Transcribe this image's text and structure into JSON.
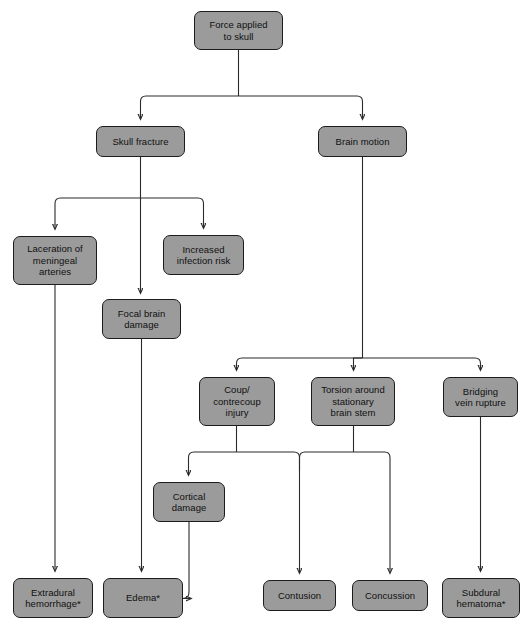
{
  "diagram": {
    "colors": {
      "node_fill": "#9b9b9b",
      "node_border": "#1c1c1c",
      "edge": "#2b2b2b",
      "background": "#ffffff",
      "text": "#101010"
    },
    "footnote_marker": "*",
    "nodes": [
      {
        "id": "force",
        "label": "Force applied\nto skull",
        "x": 194,
        "y": 11,
        "w": 89,
        "h": 39
      },
      {
        "id": "skull",
        "label": "Skull fracture",
        "x": 96,
        "y": 126,
        "w": 89,
        "h": 31
      },
      {
        "id": "brain_motion",
        "label": "Brain motion",
        "x": 318,
        "y": 126,
        "w": 89,
        "h": 31
      },
      {
        "id": "laceration",
        "label": "Laceration of\nmeningeal\narteries",
        "x": 13,
        "y": 236,
        "w": 84,
        "h": 49
      },
      {
        "id": "infection",
        "label": "Increased\ninfection risk",
        "x": 163,
        "y": 235,
        "w": 81,
        "h": 40
      },
      {
        "id": "focal",
        "label": "Focal brain\ndamage",
        "x": 102,
        "y": 299,
        "w": 79,
        "h": 40
      },
      {
        "id": "coup",
        "label": "Coup/\ncontrecoup\ninjury",
        "x": 199,
        "y": 377,
        "w": 76,
        "h": 49
      },
      {
        "id": "torsion",
        "label": "Torsion around\nstationary\nbrain stem",
        "x": 311,
        "y": 377,
        "w": 84,
        "h": 49
      },
      {
        "id": "bridging",
        "label": "Bridging\nvein rupture",
        "x": 443,
        "y": 377,
        "w": 75,
        "h": 40
      },
      {
        "id": "cortical",
        "label": "Cortical\ndamage",
        "x": 153,
        "y": 482,
        "w": 72,
        "h": 40
      },
      {
        "id": "extradural",
        "label": "Extradural\nhemorrhage*",
        "x": 13,
        "y": 578,
        "w": 80,
        "h": 40
      },
      {
        "id": "edema",
        "label": "Edema*",
        "x": 103,
        "y": 578,
        "w": 80,
        "h": 40
      },
      {
        "id": "contusion",
        "label": "Contusion",
        "x": 263,
        "y": 580,
        "w": 73,
        "h": 31
      },
      {
        "id": "concussion",
        "label": "Concussion",
        "x": 352,
        "y": 580,
        "w": 76,
        "h": 31
      },
      {
        "id": "subdural",
        "label": "Subdural\nhematoma*",
        "x": 442,
        "y": 578,
        "w": 78,
        "h": 40
      }
    ],
    "edges": [
      {
        "from": "force",
        "to": "skull"
      },
      {
        "from": "force",
        "to": "brain_motion"
      },
      {
        "from": "skull",
        "to": "laceration"
      },
      {
        "from": "skull",
        "to": "focal"
      },
      {
        "from": "skull",
        "to": "infection"
      },
      {
        "from": "brain_motion",
        "to": "coup"
      },
      {
        "from": "brain_motion",
        "to": "torsion"
      },
      {
        "from": "brain_motion",
        "to": "bridging"
      },
      {
        "from": "laceration",
        "to": "extradural"
      },
      {
        "from": "focal",
        "to": "edema"
      },
      {
        "from": "coup",
        "to": "cortical"
      },
      {
        "from": "coup",
        "to": "contusion"
      },
      {
        "from": "torsion",
        "to": "contusion"
      },
      {
        "from": "torsion",
        "to": "concussion"
      },
      {
        "from": "bridging",
        "to": "subdural"
      },
      {
        "from": "cortical",
        "to": "edema"
      }
    ]
  }
}
